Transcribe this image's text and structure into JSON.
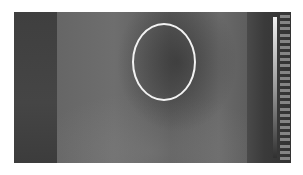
{
  "image": {
    "description": "Grayscale thermal/intensity image with an elliptical region of interest and a vertical intensity scale bar",
    "roi": {
      "shape": "ellipse",
      "color": "#f2f2f2"
    },
    "colors": {
      "background": "#ffffff",
      "dark_region": "#3e3e3e",
      "mid_region": "#666666",
      "roi_outline": "#f2f2f2"
    },
    "scale_bar": {
      "gradient": [
        "#f0f0f0",
        "#9a9a9a",
        "#303030"
      ],
      "tick_count": 24
    }
  }
}
